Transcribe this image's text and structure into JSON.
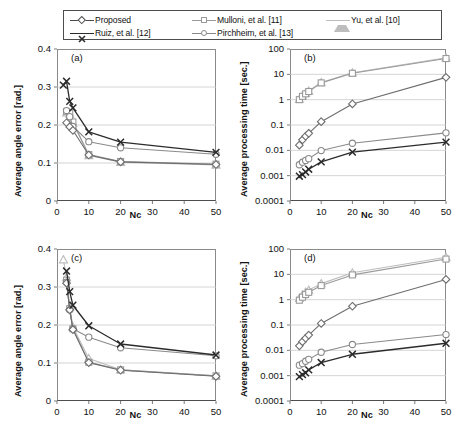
{
  "legend": {
    "items": [
      {
        "label": "Proposed",
        "marker": "diamond",
        "color": "#4a4a4a",
        "row": 0,
        "col": 0
      },
      {
        "label": "Mulloni, et al. [11]",
        "marker": "square",
        "color": "#9a9a9a",
        "row": 0,
        "col": 1
      },
      {
        "label": "Yu, et al. [10]",
        "marker": "triangle",
        "color": "#bdbdbd",
        "row": 0,
        "col": 2
      },
      {
        "label": "Ruiz, et al. [12]",
        "marker": "cross",
        "color": "#2b2b2b",
        "row": 1,
        "col": 0
      },
      {
        "label": "Pirchheim, et al. [13]",
        "marker": "circle",
        "color": "#8a8a8a",
        "row": 1,
        "col": 1
      }
    ]
  },
  "chart_data": [
    {
      "type": "line",
      "panel": "(a)",
      "title": "",
      "xlabel": "Nc",
      "ylabel": "Average angle error [rad.]",
      "xscale": "linear",
      "yscale": "linear",
      "xlim": [
        0,
        50
      ],
      "ylim": [
        0,
        0.4
      ],
      "xticks": [
        0,
        10,
        20,
        30,
        40,
        50
      ],
      "yticks": [
        0,
        0.1,
        0.2,
        0.3,
        0.4
      ],
      "yticklabels": [
        "0",
        "0.1",
        "0.2",
        "0.3",
        "0.4"
      ],
      "grid": "horizontal",
      "series": [
        {
          "name": "Proposed",
          "marker": "diamond",
          "color": "#6e6e6e",
          "x": [
            3,
            4,
            5,
            10,
            20,
            50
          ],
          "y": [
            0.206,
            0.195,
            0.186,
            0.121,
            0.103,
            0.096
          ]
        },
        {
          "name": "Mulloni, et al. [11]",
          "marker": "square",
          "color": "#9a9a9a",
          "x": [
            3,
            4,
            5,
            10,
            20,
            50
          ],
          "y": [
            0.235,
            0.232,
            0.208,
            0.122,
            0.104,
            0.097
          ]
        },
        {
          "name": "Yu, et al. [10]",
          "marker": "triangle",
          "color": "#bdbdbd",
          "x": [
            3,
            4,
            5,
            10,
            20,
            50
          ],
          "y": [
            0.232,
            0.229,
            0.205,
            0.12,
            0.102,
            0.095
          ]
        },
        {
          "name": "Ruiz, et al. [12]",
          "marker": "cross",
          "color": "#2b2b2b",
          "x": [
            2,
            3,
            4,
            5,
            10,
            20,
            50
          ],
          "y": [
            0.305,
            0.315,
            0.262,
            0.245,
            0.182,
            0.155,
            0.128
          ]
        },
        {
          "name": "Pirchheim, et al. [13]",
          "marker": "circle",
          "color": "#8a8a8a",
          "x": [
            3,
            4,
            5,
            10,
            20,
            50
          ],
          "y": [
            0.238,
            0.222,
            0.196,
            0.156,
            0.14,
            0.123
          ]
        }
      ]
    },
    {
      "type": "line",
      "panel": "(b)",
      "title": "",
      "xlabel": "Nc",
      "ylabel": "Average processing time [sec.]",
      "xscale": "linear",
      "yscale": "log",
      "xlim": [
        0,
        50
      ],
      "ylim": [
        0.0001,
        100
      ],
      "xticks": [
        0,
        10,
        20,
        30,
        40,
        50
      ],
      "yticks": [
        0.0001,
        0.001,
        0.01,
        0.1,
        1,
        10,
        100
      ],
      "yticklabels": [
        "0.0001",
        "0.001",
        "0.01",
        "0.1",
        "1",
        "10",
        "100"
      ],
      "grid": "horizontal",
      "series": [
        {
          "name": "Proposed",
          "marker": "diamond",
          "color": "#6e6e6e",
          "x": [
            3,
            4,
            5,
            6,
            10,
            20,
            50
          ],
          "y": [
            0.016,
            0.026,
            0.036,
            0.047,
            0.135,
            0.68,
            7.6
          ]
        },
        {
          "name": "Mulloni, et al. [11]",
          "marker": "square",
          "color": "#9a9a9a",
          "x": [
            3,
            4,
            5,
            6,
            10,
            20,
            50
          ],
          "y": [
            1.0,
            1.35,
            1.7,
            2.1,
            4.6,
            11.0,
            42.0
          ]
        },
        {
          "name": "Yu, et al. [10]",
          "marker": "triangle",
          "color": "#bdbdbd",
          "x": [
            3,
            4,
            5,
            6,
            10,
            20,
            50
          ],
          "y": [
            1.05,
            1.4,
            1.8,
            2.2,
            4.8,
            11.5,
            45.0
          ]
        },
        {
          "name": "Ruiz, et al. [12]",
          "marker": "cross",
          "color": "#2b2b2b",
          "x": [
            3,
            4,
            5,
            6,
            10,
            20,
            50
          ],
          "y": [
            0.00095,
            0.0011,
            0.0014,
            0.0018,
            0.0035,
            0.0085,
            0.021
          ]
        },
        {
          "name": "Pirchheim, et al. [13]",
          "marker": "circle",
          "color": "#8a8a8a",
          "x": [
            3,
            4,
            5,
            6,
            10,
            20,
            50
          ],
          "y": [
            0.0027,
            0.0034,
            0.004,
            0.0047,
            0.0098,
            0.019,
            0.049
          ]
        }
      ]
    },
    {
      "type": "line",
      "panel": "(c)",
      "title": "",
      "xlabel": "Nc",
      "ylabel": "Average angle error [rad.]",
      "xscale": "linear",
      "yscale": "linear",
      "xlim": [
        0,
        50
      ],
      "ylim": [
        0,
        0.4
      ],
      "xticks": [
        0,
        10,
        20,
        30,
        40,
        50
      ],
      "yticks": [
        0,
        0.1,
        0.2,
        0.3,
        0.4
      ],
      "yticklabels": [
        "0",
        "0.1",
        "0.2",
        "0.3",
        "0.4"
      ],
      "grid": "horizontal",
      "series": [
        {
          "name": "Proposed",
          "marker": "diamond",
          "color": "#6e6e6e",
          "x": [
            3,
            4,
            5,
            10,
            20,
            50
          ],
          "y": [
            0.31,
            0.24,
            0.188,
            0.101,
            0.081,
            0.065
          ]
        },
        {
          "name": "Mulloni, et al. [11]",
          "marker": "square",
          "color": "#9a9a9a",
          "x": [
            3,
            4,
            5,
            10,
            20,
            50
          ],
          "y": [
            0.318,
            0.243,
            0.19,
            0.102,
            0.082,
            0.066
          ]
        },
        {
          "name": "Yu, et al. [10]",
          "marker": "triangle",
          "color": "#bdbdbd",
          "x": [
            2,
            3,
            4,
            5,
            10,
            20,
            50
          ],
          "y": [
            0.372,
            0.325,
            0.248,
            0.195,
            0.112,
            0.082,
            0.066
          ]
        },
        {
          "name": "Ruiz, et al. [12]",
          "marker": "cross",
          "color": "#2b2b2b",
          "x": [
            3,
            4,
            5,
            10,
            20,
            50
          ],
          "y": [
            0.342,
            0.288,
            0.252,
            0.198,
            0.15,
            0.121
          ]
        },
        {
          "name": "Pirchheim, et al. [13]",
          "marker": "circle",
          "color": "#8a8a8a",
          "x": [
            3,
            4,
            5,
            10,
            20,
            50
          ],
          "y": [
            0.313,
            0.24,
            0.19,
            0.168,
            0.14,
            0.119
          ]
        }
      ]
    },
    {
      "type": "line",
      "panel": "(d)",
      "title": "",
      "xlabel": "Nc",
      "ylabel": "Average processing time [sec.]",
      "xscale": "linear",
      "yscale": "log",
      "xlim": [
        0,
        50
      ],
      "ylim": [
        0.0001,
        100
      ],
      "xticks": [
        0,
        10,
        20,
        30,
        40,
        50
      ],
      "yticks": [
        0.0001,
        0.001,
        0.01,
        0.1,
        1,
        10,
        100
      ],
      "yticklabels": [
        "0.0001",
        "0.001",
        "0.01",
        "0.1",
        "1",
        "10",
        "100"
      ],
      "grid": "horizontal",
      "series": [
        {
          "name": "Proposed",
          "marker": "diamond",
          "color": "#6e6e6e",
          "x": [
            3,
            4,
            5,
            6,
            10,
            20,
            50
          ],
          "y": [
            0.015,
            0.022,
            0.03,
            0.04,
            0.115,
            0.55,
            6.3
          ]
        },
        {
          "name": "Mulloni, et al. [11]",
          "marker": "square",
          "color": "#9a9a9a",
          "x": [
            3,
            4,
            5,
            6,
            10,
            20,
            50
          ],
          "y": [
            0.95,
            1.25,
            1.6,
            1.95,
            3.6,
            9.5,
            40.0
          ]
        },
        {
          "name": "Yu, et al. [10]",
          "marker": "triangle",
          "color": "#bdbdbd",
          "x": [
            3,
            4,
            5,
            6,
            10,
            20,
            50
          ],
          "y": [
            1.15,
            1.55,
            2.0,
            2.4,
            4.3,
            11.5,
            47.0
          ]
        },
        {
          "name": "Ruiz, et al. [12]",
          "marker": "cross",
          "color": "#2b2b2b",
          "x": [
            3,
            4,
            5,
            6,
            10,
            20,
            50
          ],
          "y": [
            0.00092,
            0.0011,
            0.0013,
            0.0017,
            0.0033,
            0.007,
            0.019
          ]
        },
        {
          "name": "Pirchheim, et al. [13]",
          "marker": "circle",
          "color": "#8a8a8a",
          "x": [
            3,
            4,
            5,
            6,
            10,
            20,
            50
          ],
          "y": [
            0.0026,
            0.003,
            0.0037,
            0.0044,
            0.0084,
            0.017,
            0.042
          ]
        }
      ]
    }
  ]
}
